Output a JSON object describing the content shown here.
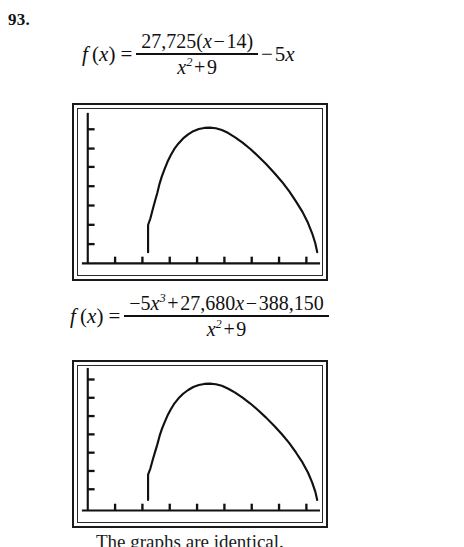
{
  "problem": {
    "number": "93."
  },
  "formulas": [
    {
      "id": "formula-top",
      "lhs": "f",
      "lhs_var": "(x)",
      "equals": "=",
      "numerator": "27,725(x−14)",
      "denominator": "x² + 9",
      "trailing": "− 5x",
      "plain_text": "f(x) = 27,725(x−14)/(x²+9) − 5x"
    },
    {
      "id": "formula-bottom",
      "lhs": "f",
      "lhs_var": "(x)",
      "equals": "=",
      "numerator": "−5x³ + 27,680x − 388,150",
      "denominator": "x² + 9",
      "trailing": "",
      "plain_text": "f(x) = (−5x³ + 27,680x − 388,150)/(x²+9)"
    }
  ],
  "numbers": {
    "coefficient_a": "27,725",
    "root_shift": "14",
    "linear_term": "5x",
    "cubic_coefficient": "−5",
    "linear_coefficient": "27,680",
    "constant_term": "388,150",
    "denominator_constant": "9"
  },
  "caption": {
    "text": "The graphs are identical."
  },
  "chart_data": {
    "type": "line",
    "title": "",
    "xlabel": "",
    "ylabel": "",
    "grid": false,
    "legend": null,
    "axis": {
      "x_ticks_count": 8,
      "y_ticks_count": 8,
      "x_axis_position_frac": 0.93,
      "y_axis_position_frac": 0.04
    },
    "curve_points_frac": [
      [
        0.262,
        0.925
      ],
      [
        0.262,
        0.745
      ],
      [
        0.272,
        0.7
      ],
      [
        0.282,
        0.64
      ],
      [
        0.292,
        0.585
      ],
      [
        0.302,
        0.53
      ],
      [
        0.312,
        0.47
      ],
      [
        0.322,
        0.42
      ],
      [
        0.334,
        0.372
      ],
      [
        0.346,
        0.325
      ],
      [
        0.36,
        0.282
      ],
      [
        0.376,
        0.24
      ],
      [
        0.394,
        0.203
      ],
      [
        0.414,
        0.17
      ],
      [
        0.436,
        0.143
      ],
      [
        0.458,
        0.122
      ],
      [
        0.482,
        0.108
      ],
      [
        0.506,
        0.1
      ],
      [
        0.53,
        0.098
      ],
      [
        0.556,
        0.102
      ],
      [
        0.582,
        0.114
      ],
      [
        0.61,
        0.134
      ],
      [
        0.64,
        0.162
      ],
      [
        0.672,
        0.198
      ],
      [
        0.706,
        0.24
      ],
      [
        0.74,
        0.288
      ],
      [
        0.774,
        0.34
      ],
      [
        0.808,
        0.396
      ],
      [
        0.842,
        0.456
      ],
      [
        0.874,
        0.52
      ],
      [
        0.904,
        0.588
      ],
      [
        0.932,
        0.658
      ],
      [
        0.956,
        0.73
      ],
      [
        0.974,
        0.8
      ],
      [
        0.988,
        0.868
      ],
      [
        0.996,
        0.925
      ]
    ]
  },
  "screens": [
    {
      "id": "calc-screen-top",
      "label": "graphing-calculator-screen-1"
    },
    {
      "id": "calc-screen-bottom",
      "label": "graphing-calculator-screen-2"
    }
  ]
}
